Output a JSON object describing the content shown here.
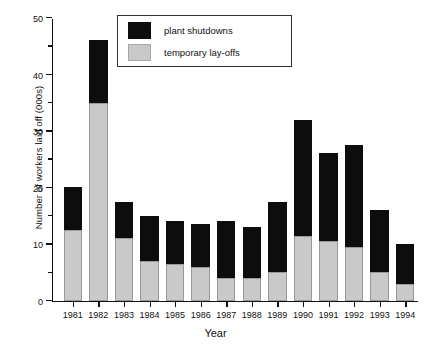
{
  "chart_data": {
    "type": "bar",
    "stacked": true,
    "title": "",
    "xlabel": "Year",
    "ylabel": "Number of workers laid off (000s)",
    "categories": [
      "1981",
      "1982",
      "1983",
      "1984",
      "1985",
      "1986",
      "1987",
      "1988",
      "1989",
      "1990",
      "1991",
      "1992",
      "1993",
      "1994"
    ],
    "ylim": [
      0,
      50
    ],
    "yticks": [
      0,
      10,
      20,
      30,
      40,
      50
    ],
    "yticks_minor": [
      5,
      15,
      25,
      35,
      45
    ],
    "ytick_labels": [
      "0",
      "10",
      "20",
      "30",
      "40",
      "50"
    ],
    "grid": false,
    "legend_position": "top-center",
    "series": [
      {
        "name": "temporary lay-offs",
        "color": "#c9c9c9",
        "values": [
          12.5,
          35,
          11,
          7,
          6.5,
          6,
          4,
          4,
          5,
          11.5,
          10.5,
          9.5,
          5,
          3
        ]
      },
      {
        "name": "plant shutdowns",
        "color": "#0d0d0d",
        "values": [
          7.5,
          11,
          6.5,
          8,
          7.5,
          7.5,
          10,
          9,
          12.5,
          20.5,
          15.5,
          18,
          11,
          7
        ]
      }
    ],
    "totals": [
      20,
      46,
      17.5,
      15,
      14,
      13.5,
      14,
      13,
      17.5,
      32,
      26,
      27.5,
      16,
      10
    ]
  },
  "legend": {
    "entries": [
      {
        "label": "plant shutdowns",
        "swatch": "black"
      },
      {
        "label": "temporary lay-offs",
        "swatch": "gray"
      }
    ]
  }
}
